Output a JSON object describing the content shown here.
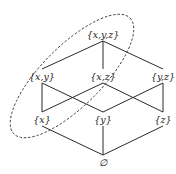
{
  "diagram": {
    "type": "hasse-diagram",
    "nodes": [
      {
        "id": "xyz",
        "label": "{x,y,z}",
        "x": 103,
        "y": 34
      },
      {
        "id": "xy",
        "label": "{x,y}",
        "x": 42,
        "y": 76
      },
      {
        "id": "xz",
        "label": "{x,z}",
        "x": 103,
        "y": 76
      },
      {
        "id": "yz",
        "label": "{y,z}",
        "x": 163,
        "y": 76
      },
      {
        "id": "x",
        "label": "{x}",
        "x": 42,
        "y": 119
      },
      {
        "id": "y",
        "label": "{y}",
        "x": 103,
        "y": 119
      },
      {
        "id": "z",
        "label": "{z}",
        "x": 163,
        "y": 119
      },
      {
        "id": "empty",
        "label": "∅",
        "x": 103,
        "y": 162
      }
    ],
    "edges": [
      [
        "xyz",
        "xy"
      ],
      [
        "xyz",
        "xz"
      ],
      [
        "xyz",
        "yz"
      ],
      [
        "xy",
        "x"
      ],
      [
        "xy",
        "y"
      ],
      [
        "xz",
        "x"
      ],
      [
        "xz",
        "z"
      ],
      [
        "yz",
        "y"
      ],
      [
        "yz",
        "z"
      ],
      [
        "x",
        "empty"
      ],
      [
        "y",
        "empty"
      ],
      [
        "z",
        "empty"
      ]
    ],
    "highlight": {
      "shape": "dashed-ellipse",
      "encloses": [
        "xyz",
        "xy",
        "xz",
        "x"
      ],
      "cx": 72,
      "cy": 76,
      "rx": 82,
      "ry": 30,
      "rotate": -45
    }
  }
}
